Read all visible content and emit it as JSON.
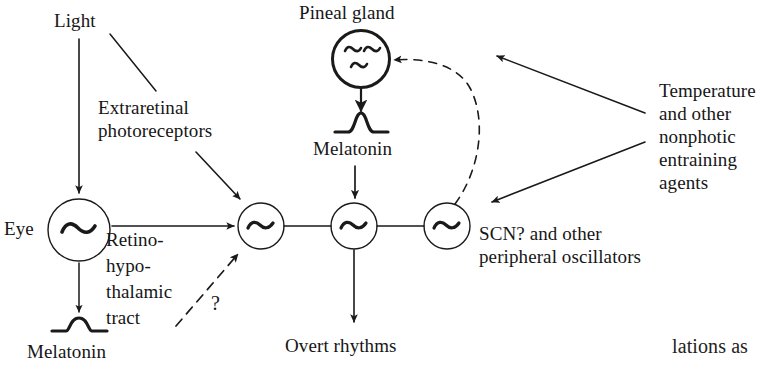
{
  "figure": {
    "type": "diagram",
    "title_visible": false,
    "background_color": "#ffffff",
    "stroke_color": "#1a1a1a",
    "width": 780,
    "height": 371
  },
  "labels": {
    "light": "Light",
    "extraretinal_photoreceptors": "Extraretinal\nphotoreceptors",
    "eye": "Eye",
    "retinohypothalamic_tract": "Retino-\nhypo-\nthalamic\ntract",
    "melatonin_left": "Melatonin",
    "question_mark": "?",
    "pineal_gland": "Pineal gland",
    "melatonin_pineal": "Melatonin",
    "overt_rhythms": "Overt rhythms",
    "scn_peripheral": "SCN? and other\nperipheral oscillators",
    "temperature_nonphotic": "Temperature\nand other\nnonphotic\nentraining\nagents",
    "page_text_fragment": "lations as"
  },
  "nodes": [
    {
      "name": "pineal-gland-oscillator",
      "glyph": "~~ ~",
      "cx": 361,
      "cy": 59,
      "r": 29,
      "stroke_width": 3
    },
    {
      "name": "eye-oscillator",
      "glyph": "~",
      "cx": 79,
      "cy": 230,
      "r": 31,
      "stroke_width": 1.4
    },
    {
      "name": "oscillator-1",
      "glyph": "~",
      "cx": 261,
      "cy": 226,
      "r": 23,
      "stroke_width": 1.4
    },
    {
      "name": "oscillator-2",
      "glyph": "~",
      "cx": 354,
      "cy": 226,
      "r": 23,
      "stroke_width": 1.4
    },
    {
      "name": "oscillator-3",
      "glyph": "~",
      "cx": 447,
      "cy": 226,
      "r": 23,
      "stroke_width": 1.4
    }
  ],
  "waveforms": [
    {
      "name": "melatonin-waveform-left",
      "x": 53,
      "y": 323,
      "style": "plateau-pulse"
    },
    {
      "name": "melatonin-waveform-pineal",
      "x": 362,
      "y": 123,
      "style": "bell-peak"
    }
  ],
  "connections": [
    {
      "name": "light-to-eye-arrow",
      "from": "Light",
      "to": "Eye",
      "style": "solid-arrow"
    },
    {
      "name": "light-to-extraretinal-line",
      "from": "Light",
      "to": "Extraretinal photoreceptors",
      "style": "plain-line"
    },
    {
      "name": "extraretinal-to-oscillator1-arrow",
      "from": "Extraretinal photoreceptors",
      "to": "oscillator-1",
      "style": "solid-arrow"
    },
    {
      "name": "eye-to-oscillator1-arrow",
      "from": "Eye",
      "to": "oscillator-1",
      "style": "solid-arrow",
      "label": "Retino-hypothalamic tract"
    },
    {
      "name": "eye-to-melatonin-arrow",
      "from": "Eye",
      "to": "Melatonin",
      "style": "solid-arrow"
    },
    {
      "name": "melatonin-to-oscillator1-dashed-arrow",
      "from": "Melatonin (eye)",
      "to": "oscillator-1",
      "style": "dashed-arrow",
      "label": "?"
    },
    {
      "name": "pineal-to-melatonin-arrow",
      "from": "Pineal gland",
      "to": "Melatonin",
      "style": "solid-arrow"
    },
    {
      "name": "melatonin-to-oscillator2-arrow",
      "from": "Melatonin",
      "to": "oscillator-2",
      "style": "solid-arrow"
    },
    {
      "name": "oscillator1-oscillator2-link",
      "from": "oscillator-1",
      "to": "oscillator-2",
      "style": "plain-line"
    },
    {
      "name": "oscillator2-oscillator3-link",
      "from": "oscillator-2",
      "to": "oscillator-3",
      "style": "plain-line"
    },
    {
      "name": "oscillator2-to-overt-rhythms-arrow",
      "from": "oscillator-2",
      "to": "Overt rhythms",
      "style": "solid-arrow"
    },
    {
      "name": "oscillator3-to-pineal-dashed-arrow",
      "from": "oscillator-3",
      "to": "Pineal gland",
      "style": "dashed-curved-arrow"
    },
    {
      "name": "temperature-to-pineal-arrow",
      "from": "Temperature and other nonphotic entraining agents",
      "to": "Pineal gland region",
      "style": "solid-arrow"
    },
    {
      "name": "temperature-to-oscillator3-arrow",
      "from": "Temperature and other nonphotic entraining agents",
      "to": "oscillator-3",
      "style": "solid-arrow"
    }
  ]
}
